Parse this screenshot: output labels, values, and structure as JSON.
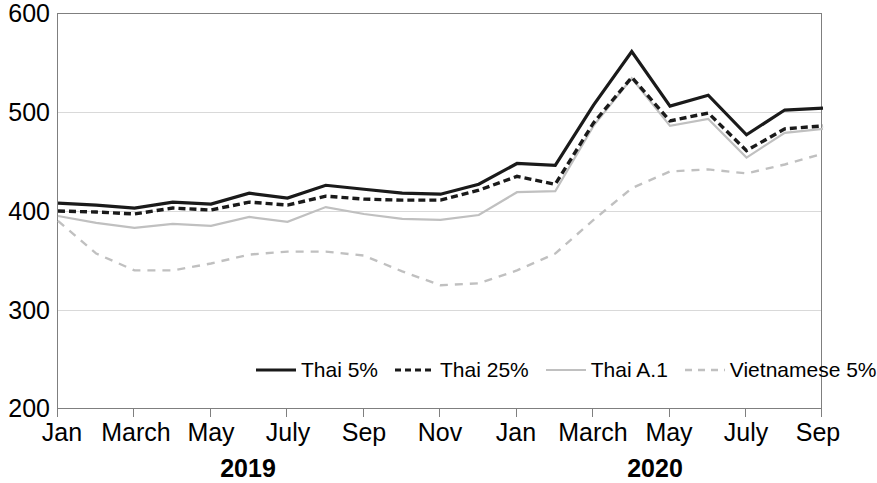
{
  "chart_data": {
    "type": "line",
    "title": "",
    "xlabel": "",
    "ylabel": "",
    "ylim": [
      200,
      600
    ],
    "y_ticks": [
      200,
      300,
      400,
      500,
      600
    ],
    "grid": "horizontal",
    "legend_position": "inside-bottom-center",
    "x_tick_labels": [
      "Jan",
      "March",
      "May",
      "July",
      "Sep",
      "Nov",
      "Jan",
      "March",
      "May",
      "July",
      "Sep"
    ],
    "x_group_labels": [
      "2019",
      "2020"
    ],
    "x": [
      "Jan 2019",
      "Feb 2019",
      "March 2019",
      "Apr 2019",
      "May 2019",
      "June 2019",
      "July 2019",
      "Aug 2019",
      "Sep 2019",
      "Oct 2019",
      "Nov 2019",
      "Dec 2019",
      "Jan 2020",
      "Feb 2020",
      "March 2020",
      "Apr 2020",
      "May 2020",
      "June 2020",
      "July 2020",
      "Aug 2020",
      "Sep 2020"
    ],
    "series": [
      {
        "name": "Thai 5%",
        "color": "#1a1a1a",
        "style": "solid",
        "values": [
          409,
          407,
          404,
          410,
          408,
          419,
          414,
          427,
          423,
          419,
          418,
          428,
          449,
          447,
          508,
          562,
          507,
          518,
          478,
          503,
          505
        ]
      },
      {
        "name": "Thai 25%",
        "color": "#1a1a1a",
        "style": "dashed",
        "values": [
          401,
          400,
          398,
          404,
          402,
          410,
          407,
          416,
          413,
          412,
          412,
          422,
          436,
          428,
          490,
          536,
          492,
          500,
          462,
          484,
          487
        ]
      },
      {
        "name": "Thai A.1",
        "color": "#c0c0c0",
        "style": "solid",
        "values": [
          396,
          389,
          384,
          388,
          386,
          395,
          390,
          405,
          398,
          393,
          392,
          397,
          420,
          421,
          487,
          535,
          487,
          494,
          455,
          480,
          484
        ]
      },
      {
        "name": "Vietnamese 5%",
        "color": "#c0c0c0",
        "style": "dashed",
        "values": [
          391,
          358,
          341,
          341,
          348,
          357,
          360,
          360,
          356,
          340,
          326,
          328,
          341,
          358,
          392,
          424,
          441,
          443,
          439,
          448,
          459
        ]
      }
    ]
  },
  "legend": {
    "items": [
      {
        "label": "Thai 5%",
        "icon": "solid-line-swatch"
      },
      {
        "label": "Thai 25%",
        "icon": "dashed-line-swatch"
      },
      {
        "label": "Thai A.1",
        "icon": "solid-gray-line-swatch"
      },
      {
        "label": "Vietnamese 5%",
        "icon": "dashed-gray-line-swatch"
      }
    ]
  },
  "axes": {
    "y_labels": [
      "600",
      "500",
      "400",
      "300",
      "200"
    ],
    "x_labels": [
      "Jan",
      "March",
      "May",
      "July",
      "Sep",
      "Nov",
      "Jan",
      "March",
      "May",
      "July",
      "Sep"
    ],
    "year_labels": [
      "2019",
      "2020"
    ]
  }
}
